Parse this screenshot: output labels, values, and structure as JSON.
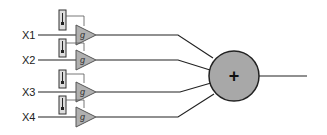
{
  "diagram": {
    "inputs": [
      {
        "label": "X1",
        "y": 35,
        "gain": "g"
      },
      {
        "label": "X2",
        "y": 60,
        "gain": "g"
      },
      {
        "label": "X3",
        "y": 92,
        "gain": "g"
      },
      {
        "label": "X4",
        "y": 117,
        "gain": "g"
      }
    ],
    "summer": {
      "symbol": "+",
      "cx": 234,
      "cy": 76,
      "r": 25,
      "fill": "#a8a8a8"
    },
    "output": {
      "x_end": 307
    }
  }
}
